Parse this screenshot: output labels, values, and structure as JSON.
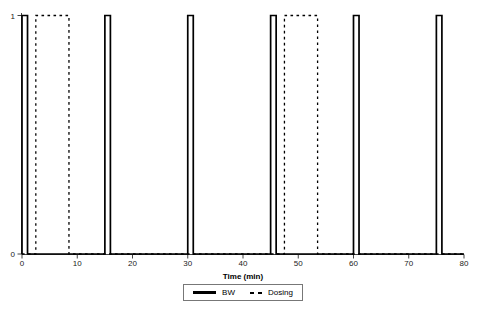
{
  "figure": {
    "background": "#ffffff",
    "title": ""
  },
  "chart_data": {
    "type": "line",
    "subtype": "square-pulse-train",
    "title": "",
    "xlabel": "Time (min)",
    "ylabel": "",
    "xlim": [
      0,
      80
    ],
    "ylim": [
      0,
      1
    ],
    "x_ticks": [
      0,
      10,
      20,
      30,
      40,
      50,
      60,
      70,
      80
    ],
    "y_ticks": [
      0,
      1
    ],
    "grid": false,
    "legend_position": "bottom-center-outside",
    "colors": {
      "line": "#000000",
      "axis": "#444444",
      "tick_label": "#222222",
      "legend_border": "#777777"
    },
    "series": [
      {
        "name": "BW",
        "line_style": "solid",
        "line_width": 1.7,
        "low": 0,
        "high": 1,
        "pulses": [
          [
            0,
            1
          ],
          [
            15,
            16
          ],
          [
            30,
            31
          ],
          [
            45,
            46
          ],
          [
            60,
            61
          ],
          [
            75,
            76
          ]
        ]
      },
      {
        "name": "Dosing",
        "line_style": "dashed",
        "line_width": 1.3,
        "low": 0,
        "high": 1,
        "pulses": [
          [
            2.5,
            8.5
          ],
          [
            47.5,
            53.5
          ]
        ]
      }
    ]
  }
}
